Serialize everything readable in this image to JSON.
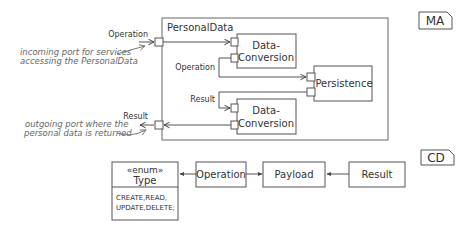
{
  "ma_diagram": {
    "tag": "MA",
    "component": {
      "title": "PersonalData",
      "outer_ports": {
        "operation_label": "Operation",
        "result_label": "Result"
      },
      "subcomponents": [
        {
          "id": "dc1",
          "line1": "Data-",
          "line2": "Conversion"
        },
        {
          "id": "persistence",
          "line1": "Persistence"
        },
        {
          "id": "dc2",
          "line1": "Data-",
          "line2": "Conversion"
        }
      ],
      "inner_labels": {
        "operation": "Operation",
        "result": "Result"
      }
    },
    "annotations": {
      "incoming": {
        "line1": "incoming port for services",
        "line2": "accessing the PersonalData"
      },
      "outgoing": {
        "line1": "outgoing port where the",
        "line2": "personal data is returned"
      }
    }
  },
  "cd_diagram": {
    "tag": "CD",
    "enum_class": {
      "stereotype": "«enum»",
      "name": "Type",
      "values_line1": "CREATE,READ,",
      "values_line2": "UPDATE,DELETE;"
    },
    "classes": {
      "operation": "Operation",
      "payload": "Payload",
      "result": "Result"
    }
  }
}
